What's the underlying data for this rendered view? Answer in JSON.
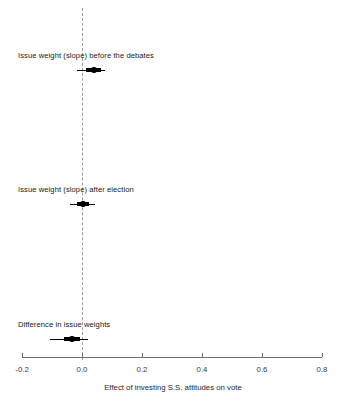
{
  "chart_data": {
    "type": "scatter",
    "subtype": "dot-and-whisker coefficient plot",
    "title": "",
    "xlabel": "Effect of investing S.S. attitudes on vote",
    "ylabel": "",
    "xlim": [
      -0.2,
      0.8
    ],
    "xticks": [
      -0.2,
      0.0,
      0.2,
      0.4,
      0.6,
      0.8
    ],
    "xticklabels": [
      "-0.2",
      "0.0",
      "0.2",
      "0.4",
      "0.6",
      "0.8"
    ],
    "grid": false,
    "legend": null,
    "reference_line": {
      "x": 0.0,
      "style": "dashed",
      "color": "#9a9a9a"
    },
    "categories": [
      "Issue weight (slope) before the debates",
      "Issue weight (slope) after election",
      "Difference in issue weights"
    ],
    "values": [
      0.04,
      0.003,
      -0.033
    ],
    "points": [
      {
        "label": "Issue weight (slope) before the debates",
        "estimate": 0.04,
        "inner_low": 0.012,
        "inner_high": 0.063,
        "outer_low": -0.017,
        "outer_high": 0.077
      },
      {
        "label": "Issue weight (slope) after election",
        "estimate": 0.003,
        "inner_low": -0.017,
        "inner_high": 0.023,
        "outer_low": -0.04,
        "outer_high": 0.043
      },
      {
        "label": "Difference in issue weights",
        "estimate": -0.033,
        "inner_low": -0.06,
        "inner_high": -0.007,
        "outer_low": -0.107,
        "outer_high": 0.02
      }
    ]
  },
  "axis": {
    "ticks": [
      {
        "value": "-0.2"
      },
      {
        "value": "0.0"
      },
      {
        "value": "0.2"
      },
      {
        "value": "0.4"
      },
      {
        "value": "0.6"
      },
      {
        "value": "0.8"
      }
    ],
    "title": "Effect of investing S.S. attitudes on vote"
  },
  "rows": [
    {
      "label": "Issue weight (slope) before the debates"
    },
    {
      "label": "Issue weight (slope) after election"
    },
    {
      "label": "Difference in issue weights"
    }
  ]
}
